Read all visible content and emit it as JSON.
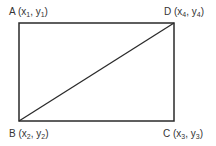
{
  "diagram": {
    "type": "rectangle-with-diagonal",
    "line_color": "#2a2a2a",
    "rectangle": {
      "x": 19,
      "y": 23,
      "width": 155,
      "height": 98
    },
    "diagonal": {
      "from": "B",
      "to": "D"
    },
    "vertices": [
      {
        "id": "A",
        "letter": "A",
        "x_var": "x",
        "x_sub": "1",
        "y_var": "y",
        "y_sub": "1",
        "position": "top-left"
      },
      {
        "id": "D",
        "letter": "D",
        "x_var": "x",
        "x_sub": "4",
        "y_var": "y",
        "y_sub": "4",
        "position": "top-right"
      },
      {
        "id": "B",
        "letter": "B",
        "x_var": "x",
        "x_sub": "2",
        "y_var": "y",
        "y_sub": "2",
        "position": "bottom-left"
      },
      {
        "id": "C",
        "letter": "C",
        "x_var": "x",
        "x_sub": "3",
        "y_var": "y",
        "y_sub": "3",
        "position": "bottom-right"
      }
    ]
  }
}
